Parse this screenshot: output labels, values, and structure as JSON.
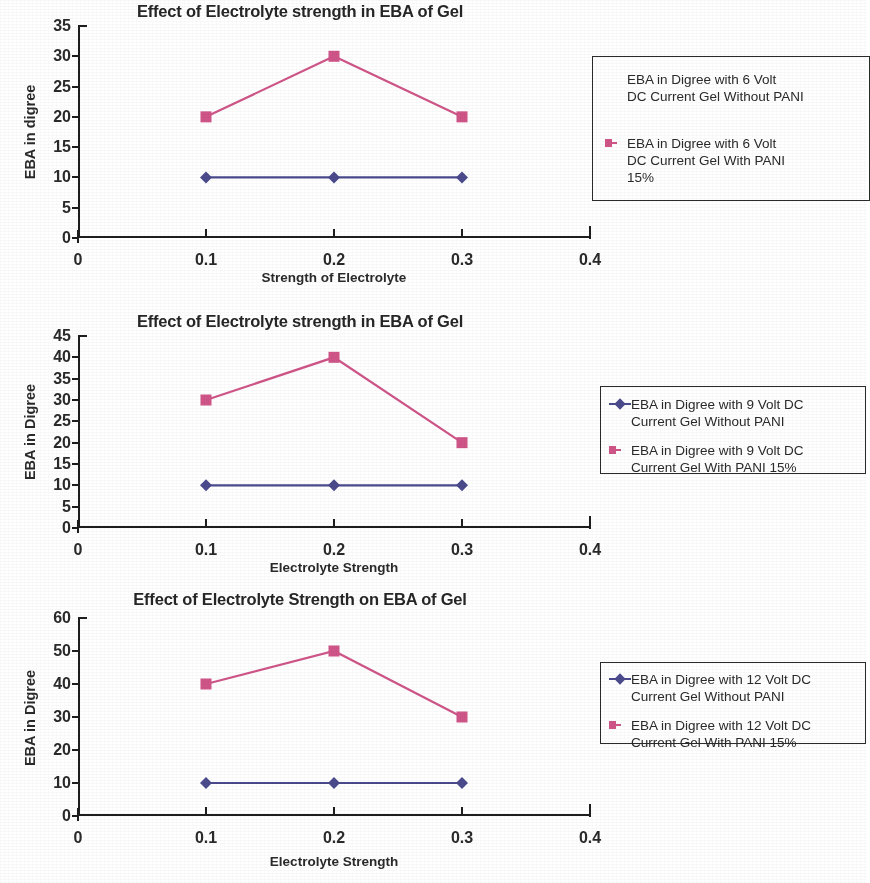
{
  "page": {
    "background": "#ffffff",
    "series_colors": {
      "without_pani": "#4a4a8c",
      "with_pani": "#cf5588"
    }
  },
  "chart_data": [
    {
      "type": "line",
      "title": "Effect of Electrolyte strength in EBA of Gel",
      "xlabel": "Strength of Electrolyte",
      "ylabel": "EBA in digree",
      "x": [
        0.1,
        0.2,
        0.3
      ],
      "xlim": [
        0,
        0.4
      ],
      "ylim": [
        0,
        35
      ],
      "xticks": [
        "0",
        "0.1",
        "0.2",
        "0.3",
        "0.4"
      ],
      "yticks": [
        "0",
        "5",
        "10",
        "15",
        "20",
        "25",
        "30",
        "35"
      ],
      "grid": false,
      "legend_position": "right",
      "series": [
        {
          "name": "EBA in Digree  with  6 Volt\nDC Current  Gel Without PANI",
          "marker": "diamond",
          "color": "#4a4a8c",
          "marker_visible_in_legend": false,
          "values": [
            10,
            10,
            10
          ]
        },
        {
          "name": "EBA in Digree  with  6 Volt\nDC Current Gel With PANI\n15%",
          "marker": "square",
          "color": "#cf5588",
          "marker_visible_in_legend": true,
          "values": [
            20,
            30,
            20
          ]
        }
      ]
    },
    {
      "type": "line",
      "title": "Effect of Electrolyte strength in EBA of Gel",
      "xlabel": "Electrolyte Strength",
      "ylabel": "EBA in Digree",
      "x": [
        0.1,
        0.2,
        0.3
      ],
      "xlim": [
        0,
        0.4
      ],
      "ylim": [
        0,
        45
      ],
      "xticks": [
        "0",
        "0.1",
        "0.2",
        "0.3",
        "0.4"
      ],
      "yticks": [
        "0",
        "5",
        "10",
        "15",
        "20",
        "25",
        "30",
        "35",
        "40",
        "45"
      ],
      "grid": false,
      "legend_position": "right",
      "series": [
        {
          "name": "EBA in Digree  with  9 Volt DC\nCurrent  Gel Without PANI",
          "marker": "diamond",
          "color": "#4a4a8c",
          "marker_visible_in_legend": true,
          "values": [
            10,
            10,
            10
          ]
        },
        {
          "name": "EBA in Digree  with  9 Volt DC\nCurrent Gel With PANI 15%",
          "marker": "square",
          "color": "#cf5588",
          "marker_visible_in_legend": true,
          "values": [
            30,
            40,
            20
          ]
        }
      ]
    },
    {
      "type": "line",
      "title": "Effect of Electrolyte Strength on EBA of Gel",
      "xlabel": "Electrolyte Strength",
      "ylabel": "EBA in Digree",
      "x": [
        0.1,
        0.2,
        0.3
      ],
      "xlim": [
        0,
        0.4
      ],
      "ylim": [
        0,
        60
      ],
      "xticks": [
        "0",
        "0.1",
        "0.2",
        "0.3",
        "0.4"
      ],
      "yticks": [
        "0",
        "10",
        "20",
        "30",
        "40",
        "50",
        "60"
      ],
      "grid": false,
      "legend_position": "right",
      "series": [
        {
          "name": "EBA in Digree  with  12 Volt DC\nCurrent  Gel Without PANI",
          "marker": "diamond",
          "color": "#4a4a8c",
          "marker_visible_in_legend": true,
          "values": [
            10,
            10,
            10
          ]
        },
        {
          "name": "EBA in Digree  with  12 Volt DC\nCurrent Gel With PANI 15%",
          "marker": "square",
          "color": "#cf5588",
          "marker_visible_in_legend": true,
          "values": [
            40,
            50,
            30
          ]
        }
      ]
    }
  ]
}
